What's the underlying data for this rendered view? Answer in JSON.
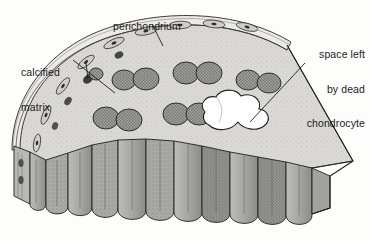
{
  "figure": {
    "background_color": "#fdfdfb",
    "ink_color": "#1b1b1b"
  },
  "labels": {
    "perichondrium": {
      "text": "perichondrium"
    },
    "calcified_matrix": {
      "line1": "calcified",
      "line2": "matrix"
    },
    "dead_chondrocyte": {
      "line1": "space left",
      "line2": "by dead",
      "line3": "chondrocyte"
    }
  },
  "palette": {
    "top_surface": "#d9d8d4",
    "cut_face": "#a9a9a7",
    "cut_face_dark": "#8e8e8c",
    "cut_face_light": "#bdbdba",
    "side_face": "#b5b5b2",
    "cavity": "#ffffff",
    "cell_fill": "#8a8a88",
    "outline": "#1b1b1b",
    "perichondrium_band": "#e7e6e2"
  },
  "structures": {
    "perichondrium": "thin outer membrane of flattened elongated cells",
    "calcified_matrix": "dark granular band within the outer zone",
    "chondrocytes": "paired oval cells embedded in the top matrix surface",
    "lacuna": "white multi-lobed space left by a dead chondrocyte",
    "columns": "scalloped columnar lobes on the cut face"
  }
}
